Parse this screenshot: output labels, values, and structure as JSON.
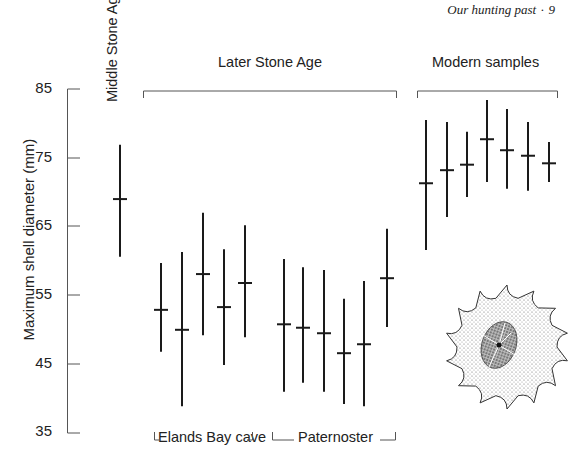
{
  "running_head": {
    "title": "Our hunting past",
    "page_number": "9"
  },
  "chart_data": {
    "type": "range-plot",
    "title": "",
    "xlabel": "",
    "ylabel": "Maximum shell diameter (mm)",
    "ylim": [
      35,
      85
    ],
    "yticks": [
      35,
      45,
      55,
      65,
      75,
      85
    ],
    "grid": false,
    "legend": null,
    "groups": [
      {
        "name": "Middle Stone Age",
        "subgroup": "",
        "samples": [
          {
            "min": 60.6,
            "mean": 69.0,
            "max": 76.9
          }
        ]
      },
      {
        "name": "Later Stone Age",
        "subgroup": "Elands Bay cave",
        "samples": [
          {
            "min": 46.8,
            "mean": 52.9,
            "max": 59.7
          },
          {
            "min": 38.9,
            "mean": 50.0,
            "max": 61.3
          },
          {
            "min": 49.2,
            "mean": 58.1,
            "max": 67.0
          },
          {
            "min": 44.9,
            "mean": 53.3,
            "max": 61.7
          },
          {
            "min": 48.9,
            "mean": 56.8,
            "max": 65.2
          }
        ]
      },
      {
        "name": "Later Stone Age",
        "subgroup": "Paternoster",
        "samples": [
          {
            "min": 41.0,
            "mean": 50.8,
            "max": 60.3
          },
          {
            "min": 42.3,
            "mean": 50.3,
            "max": 59.1
          },
          {
            "min": 41.0,
            "mean": 49.5,
            "max": 58.7
          },
          {
            "min": 39.2,
            "mean": 46.6,
            "max": 54.5
          },
          {
            "min": 38.9,
            "mean": 47.9,
            "max": 57.1
          },
          {
            "min": 50.4,
            "mean": 57.5,
            "max": 64.7
          }
        ]
      },
      {
        "name": "Modern samples",
        "subgroup": "",
        "samples": [
          {
            "min": 61.6,
            "mean": 71.3,
            "max": 80.5
          },
          {
            "min": 66.4,
            "mean": 73.2,
            "max": 80.2
          },
          {
            "min": 69.3,
            "mean": 74.0,
            "max": 78.8
          },
          {
            "min": 71.5,
            "mean": 77.7,
            "max": 83.4
          },
          {
            "min": 70.5,
            "mean": 76.1,
            "max": 82.1
          },
          {
            "min": 70.2,
            "mean": 75.3,
            "max": 80.2
          },
          {
            "min": 71.5,
            "mean": 74.2,
            "max": 77.3
          }
        ]
      }
    ],
    "annotations": [
      "Middle Stone Age",
      "Later Stone Age",
      "Modern samples",
      "Elands Bay cave",
      "Paternoster"
    ],
    "illustration": "limpet shell drawing"
  },
  "labels": {
    "msa": "Middle Stone Age",
    "lsa": "Later Stone Age",
    "modern": "Modern samples",
    "elands": "Elands Bay cave",
    "paternoster": "Paternoster",
    "ylabel": "Maximum shell diameter (mm)",
    "ticks": [
      "85",
      "75",
      "65",
      "55",
      "45",
      "35"
    ]
  }
}
